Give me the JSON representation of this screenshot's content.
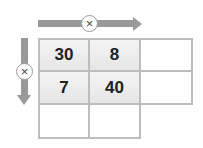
{
  "diagram": {
    "type": "multiplication-grid",
    "operators": {
      "horizontal": {
        "symbol": "×",
        "icon": "times-icon"
      },
      "vertical": {
        "symbol": "×",
        "icon": "times-icon"
      }
    },
    "grid": [
      [
        "30",
        "8",
        ""
      ],
      [
        "7",
        "40",
        ""
      ],
      [
        "",
        ""
      ]
    ],
    "colors": {
      "arrow": "#999999",
      "border": "#bdbdbd",
      "filled_cell": "#ececec",
      "empty_cell": "#ffffff",
      "text": "#222222"
    }
  }
}
